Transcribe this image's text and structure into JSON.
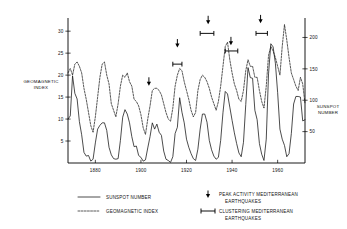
{
  "chart_data": {
    "type": "line",
    "title": "",
    "xlabel": "",
    "ylabel": "GEOMAGNETIC INDEX",
    "y2label": "SUNSPOT NUMBER",
    "xlim": [
      1868,
      1972
    ],
    "ylim": [
      0,
      33
    ],
    "y2lim": [
      0,
      231
    ],
    "grid": false,
    "legend_position": "below-plot",
    "xticks": [
      1880,
      1900,
      1920,
      1940,
      1960
    ],
    "xticklabels": [
      "1880",
      "1900",
      "1920",
      "1940",
      "1960"
    ],
    "yticks": [
      5,
      10,
      15,
      20,
      25,
      30
    ],
    "yticklabels": [
      "5",
      "10",
      "15",
      "20",
      "25",
      "30"
    ],
    "y2ticks": [
      50,
      100,
      150,
      200
    ],
    "y2ticklabels": [
      "50",
      "100",
      "150",
      "200"
    ],
    "series": [
      {
        "name": "SUNSPOT NUMBER",
        "style": "solid",
        "axis": "right",
        "x": [
          1868,
          1869,
          1870,
          1871,
          1872,
          1873,
          1874,
          1875,
          1876,
          1877,
          1878,
          1879,
          1880,
          1881,
          1882,
          1883,
          1884,
          1885,
          1886,
          1887,
          1888,
          1889,
          1890,
          1891,
          1892,
          1893,
          1894,
          1895,
          1896,
          1897,
          1898,
          1899,
          1900,
          1901,
          1902,
          1903,
          1904,
          1905,
          1906,
          1907,
          1908,
          1909,
          1910,
          1911,
          1912,
          1913,
          1914,
          1915,
          1916,
          1917,
          1918,
          1919,
          1920,
          1921,
          1922,
          1923,
          1924,
          1925,
          1926,
          1927,
          1928,
          1929,
          1930,
          1931,
          1932,
          1933,
          1934,
          1935,
          1936,
          1937,
          1938,
          1939,
          1940,
          1941,
          1942,
          1943,
          1944,
          1945,
          1946,
          1947,
          1948,
          1949,
          1950,
          1951,
          1952,
          1953,
          1954,
          1955,
          1956,
          1957,
          1958,
          1959,
          1960,
          1961,
          1962,
          1963,
          1964,
          1965,
          1966,
          1967,
          1968,
          1969,
          1970,
          1971,
          1972
        ],
        "values": [
          70,
          75,
          139,
          111,
          102,
          66,
          45,
          17,
          11,
          12,
          3,
          6,
          32,
          54,
          60,
          64,
          64,
          52,
          25,
          13,
          7,
          6,
          7,
          36,
          73,
          85,
          78,
          64,
          42,
          26,
          27,
          12,
          9,
          3,
          5,
          24,
          42,
          64,
          54,
          62,
          49,
          44,
          19,
          6,
          4,
          1,
          10,
          47,
          57,
          104,
          81,
          64,
          38,
          25,
          15,
          7,
          4,
          22,
          54,
          78,
          78,
          65,
          36,
          21,
          11,
          6,
          9,
          36,
          80,
          114,
          110,
          89,
          68,
          48,
          31,
          16,
          10,
          33,
          93,
          152,
          136,
          135,
          84,
          69,
          31,
          14,
          4,
          38,
          142,
          190,
          185,
          159,
          112,
          54,
          38,
          28,
          10,
          15,
          47,
          94,
          106,
          106,
          105,
          67,
          69
        ]
      },
      {
        "name": "GEOMAGNETIC INDEX",
        "style": "dashed",
        "axis": "left",
        "x": [
          1868,
          1869,
          1870,
          1871,
          1872,
          1873,
          1874,
          1875,
          1876,
          1877,
          1878,
          1879,
          1880,
          1881,
          1882,
          1883,
          1884,
          1885,
          1886,
          1887,
          1888,
          1889,
          1890,
          1891,
          1892,
          1893,
          1894,
          1895,
          1896,
          1897,
          1898,
          1899,
          1900,
          1901,
          1902,
          1903,
          1904,
          1905,
          1906,
          1907,
          1908,
          1909,
          1910,
          1911,
          1912,
          1913,
          1914,
          1915,
          1916,
          1917,
          1918,
          1919,
          1920,
          1921,
          1922,
          1923,
          1924,
          1925,
          1926,
          1927,
          1928,
          1929,
          1930,
          1931,
          1932,
          1933,
          1934,
          1935,
          1936,
          1937,
          1938,
          1939,
          1940,
          1941,
          1942,
          1943,
          1944,
          1945,
          1946,
          1947,
          1948,
          1949,
          1950,
          1951,
          1952,
          1953,
          1954,
          1955,
          1956,
          1957,
          1958,
          1959,
          1960,
          1961,
          1962,
          1963,
          1964,
          1965,
          1966,
          1967,
          1968,
          1969,
          1970,
          1971,
          1972
        ],
        "values": [
          20.5,
          21.5,
          20.0,
          22.5,
          23.0,
          22.0,
          20.5,
          17.0,
          14.5,
          11.5,
          8.5,
          7.0,
          10.5,
          15.0,
          19.5,
          22.5,
          23.0,
          20.0,
          18.0,
          13.5,
          12.0,
          10.5,
          13.5,
          17.5,
          20.0,
          19.5,
          20.5,
          18.5,
          17.5,
          14.5,
          14.0,
          13.0,
          11.0,
          8.0,
          6.5,
          10.0,
          13.0,
          16.5,
          17.0,
          17.0,
          16.5,
          15.5,
          13.5,
          11.5,
          10.0,
          9.5,
          12.5,
          17.5,
          20.0,
          21.5,
          21.0,
          18.5,
          16.5,
          14.5,
          12.0,
          10.5,
          11.5,
          16.5,
          19.0,
          20.0,
          19.5,
          18.5,
          17.0,
          15.0,
          13.5,
          12.0,
          14.0,
          17.5,
          22.0,
          26.5,
          27.5,
          23.5,
          20.5,
          18.0,
          16.5,
          14.5,
          14.0,
          16.5,
          21.0,
          23.5,
          22.0,
          22.0,
          19.5,
          19.5,
          16.5,
          14.0,
          12.5,
          17.5,
          24.5,
          26.5,
          25.5,
          24.0,
          22.0,
          20.0,
          26.5,
          31.5,
          28.0,
          24.0,
          20.5,
          19.0,
          17.5,
          16.5,
          19.5,
          18.0,
          13.5
        ]
      }
    ],
    "annotations": {
      "peak_activity": {
        "label": "PEAK ACTIVITY MEDITERRANEAN EARTHQUAKES",
        "marker": "down-arrow",
        "items": [
          {
            "x": 1903.5,
            "y": 17.8
          },
          {
            "x": 1916.0,
            "y": 26.5
          },
          {
            "x": 1929.5,
            "y": 31.8
          },
          {
            "x": 1939.5,
            "y": 27.0
          },
          {
            "x": 1952.5,
            "y": 32.0
          }
        ]
      },
      "clustering": {
        "label": "CLUSTERING MEDITERRANEAN EARTHQUAKES",
        "marker": "horizontal-bar",
        "items": [
          {
            "x0": 1914.0,
            "x1": 1918.0,
            "y": 22.5
          },
          {
            "x0": 1926.0,
            "x1": 1932.0,
            "y": 29.5
          },
          {
            "x0": 1937.0,
            "x1": 1942.5,
            "y": 25.5
          },
          {
            "x0": 1950.5,
            "x1": 1955.5,
            "y": 29.5
          }
        ]
      }
    },
    "legend": [
      {
        "label": "SUNSPOT NUMBER",
        "marker": "solid-line"
      },
      {
        "label": "GEOMAGNETIC INDEX",
        "marker": "dashed-line"
      },
      {
        "label": "PEAK ACTIVITY MEDITERRANEAN",
        "label2": "EARTHQUAKES",
        "marker": "down-arrow"
      },
      {
        "label": "CLUSTERING MEDITERRANEAN",
        "label2": "EARTHQUAKES",
        "marker": "horizontal-bar"
      }
    ]
  }
}
